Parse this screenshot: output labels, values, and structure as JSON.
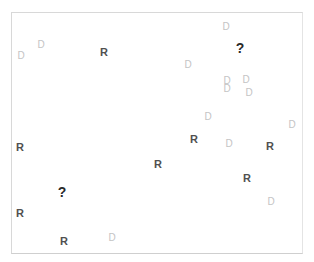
{
  "board": {
    "legend": {
      "R": "robot",
      "D": "debris",
      "?": "unknown"
    },
    "colors": {
      "R": "#505050",
      "D": "#c4c4c4",
      "?": "#2a2a2a",
      "border": "#d8d8d8"
    },
    "cells": [
      {
        "glyph": "D",
        "x": 21,
        "y": 56
      },
      {
        "glyph": "D",
        "x": 41,
        "y": 45
      },
      {
        "glyph": "R",
        "x": 104,
        "y": 52
      },
      {
        "glyph": "D",
        "x": 226,
        "y": 27
      },
      {
        "glyph": "?",
        "x": 240,
        "y": 48
      },
      {
        "glyph": "D",
        "x": 188,
        "y": 65
      },
      {
        "glyph": "D",
        "x": 227,
        "y": 81
      },
      {
        "glyph": "D",
        "x": 227,
        "y": 89
      },
      {
        "glyph": "D",
        "x": 246,
        "y": 80
      },
      {
        "glyph": "D",
        "x": 249,
        "y": 93
      },
      {
        "glyph": "D",
        "x": 208,
        "y": 117
      },
      {
        "glyph": "D",
        "x": 292,
        "y": 125
      },
      {
        "glyph": "R",
        "x": 20,
        "y": 147
      },
      {
        "glyph": "R",
        "x": 194,
        "y": 139
      },
      {
        "glyph": "D",
        "x": 229,
        "y": 144
      },
      {
        "glyph": "R",
        "x": 270,
        "y": 146
      },
      {
        "glyph": "R",
        "x": 158,
        "y": 164
      },
      {
        "glyph": "R",
        "x": 247,
        "y": 178
      },
      {
        "glyph": "?",
        "x": 62,
        "y": 192
      },
      {
        "glyph": "D",
        "x": 271,
        "y": 202
      },
      {
        "glyph": "R",
        "x": 20,
        "y": 213
      },
      {
        "glyph": "R",
        "x": 64,
        "y": 241
      },
      {
        "glyph": "D",
        "x": 112,
        "y": 238
      }
    ]
  }
}
